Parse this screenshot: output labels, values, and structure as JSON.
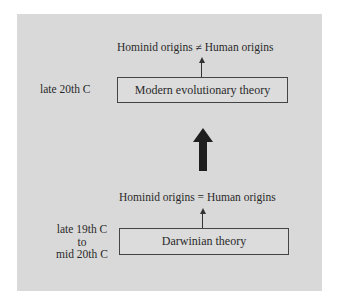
{
  "diagram": {
    "upper": {
      "era_label": "late 20th C",
      "theory": "Modern evolutionary theory",
      "statement": "Hominid origins ≠ Human origins"
    },
    "lower": {
      "era_lines": [
        "late 19th C",
        "to",
        "mid 20th C"
      ],
      "theory": "Darwinian theory",
      "statement": "Hominid origins = Human origins"
    },
    "transition_arrow": "up-arrow",
    "colors": {
      "panel": "#d9d9d9",
      "background": "#ffffff",
      "arrow": "#1e1e1e",
      "box_border": "#444444"
    }
  }
}
